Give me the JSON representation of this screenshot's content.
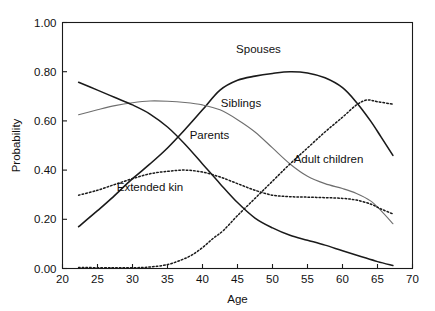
{
  "chart_data": {
    "type": "line",
    "title": "",
    "xlabel": "Age",
    "ylabel": "Probability",
    "xlim": [
      20,
      70
    ],
    "ylim": [
      0.0,
      1.0
    ],
    "xticks": [
      20,
      25,
      30,
      35,
      40,
      45,
      50,
      55,
      60,
      65,
      70
    ],
    "xticklabels": [
      "20",
      "25",
      "30",
      "35",
      "40",
      "45",
      "50",
      "55",
      "60",
      "65",
      "70"
    ],
    "yticks": [
      0.0,
      0.2,
      0.4,
      0.6,
      0.8,
      1.0
    ],
    "yticklabels": [
      "0.00",
      "0.20",
      "0.40",
      "0.60",
      "0.80",
      "1.00"
    ],
    "grid": false,
    "legend_position": "inline-annotations",
    "series": [
      {
        "name": "Spouses",
        "style": "solid",
        "color": "#1a1a1a",
        "width": 1.6,
        "label_x": 48,
        "label_y": 0.875,
        "x": [
          22.3,
          25,
          27,
          30,
          32.5,
          35,
          37.5,
          40,
          42.5,
          45,
          47.5,
          50,
          52.5,
          55,
          57.5,
          60,
          62,
          64,
          65.5,
          67.2
        ],
        "y": [
          0.17,
          0.235,
          0.285,
          0.365,
          0.425,
          0.49,
          0.565,
          0.645,
          0.725,
          0.765,
          0.782,
          0.793,
          0.8,
          0.795,
          0.775,
          0.735,
          0.675,
          0.6,
          0.535,
          0.46
        ]
      },
      {
        "name": "Siblings",
        "style": "solid",
        "color": "#6e6e6e",
        "width": 1.1,
        "label_x": 45.5,
        "label_y": 0.655,
        "x": [
          22.3,
          25,
          27.5,
          30,
          32.5,
          35,
          37.5,
          40,
          42.5,
          45,
          47.5,
          50,
          52.5,
          55,
          57.5,
          60,
          62,
          64,
          65.5,
          67.2
        ],
        "y": [
          0.625,
          0.645,
          0.662,
          0.674,
          0.681,
          0.68,
          0.675,
          0.665,
          0.645,
          0.605,
          0.555,
          0.49,
          0.425,
          0.375,
          0.345,
          0.325,
          0.305,
          0.275,
          0.235,
          0.182
        ]
      },
      {
        "name": "Parents",
        "style": "solid",
        "color": "#1a1a1a",
        "width": 1.5,
        "label_x": 41,
        "label_y": 0.525,
        "x": [
          22.3,
          25,
          27.5,
          30,
          32.5,
          35,
          37.5,
          40,
          42.5,
          45,
          47.5,
          50,
          52.5,
          55,
          57.5,
          60,
          62.5,
          65,
          67.2
        ],
        "y": [
          0.757,
          0.725,
          0.695,
          0.665,
          0.628,
          0.575,
          0.505,
          0.425,
          0.345,
          0.268,
          0.205,
          0.165,
          0.135,
          0.115,
          0.095,
          0.072,
          0.05,
          0.028,
          0.012
        ]
      },
      {
        "name": "Adult children",
        "style": "dotted",
        "color": "#1a1a1a",
        "width": 1.5,
        "label_x": 58,
        "label_y": 0.43,
        "x": [
          22.3,
          27,
          30,
          32.5,
          35,
          37,
          38.5,
          40,
          41.5,
          43,
          45,
          47.5,
          50,
          52.5,
          55,
          57.5,
          60,
          62,
          63.5,
          65,
          67.2
        ],
        "y": [
          0.004,
          0.003,
          0.003,
          0.006,
          0.016,
          0.035,
          0.055,
          0.085,
          0.122,
          0.155,
          0.215,
          0.285,
          0.355,
          0.425,
          0.49,
          0.555,
          0.615,
          0.665,
          0.685,
          0.678,
          0.668
        ]
      },
      {
        "name": "Extended kin",
        "style": "dotted",
        "color": "#1a1a1a",
        "width": 1.5,
        "label_x": 32.5,
        "label_y": 0.315,
        "x": [
          22.3,
          25,
          27.5,
          30,
          32.5,
          35,
          37.5,
          40,
          42.5,
          45,
          47.5,
          50,
          52.5,
          55,
          57.5,
          60,
          62,
          64,
          65.5,
          67.2
        ],
        "y": [
          0.298,
          0.318,
          0.342,
          0.365,
          0.385,
          0.395,
          0.4,
          0.392,
          0.372,
          0.345,
          0.318,
          0.298,
          0.292,
          0.29,
          0.288,
          0.285,
          0.278,
          0.262,
          0.242,
          0.222
        ]
      }
    ]
  }
}
